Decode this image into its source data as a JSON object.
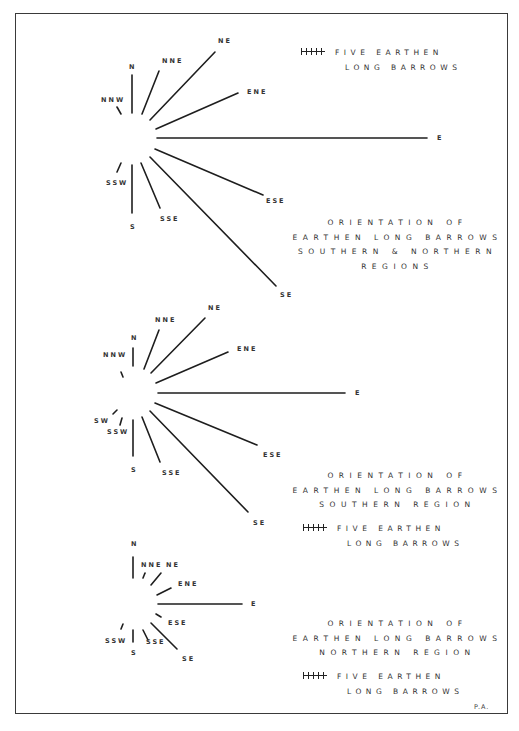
{
  "figure": {
    "signature": "P.A.",
    "legend": {
      "scale_icon": "tally-scale-icon",
      "line1": "FIVE EARTHEN",
      "line2": "LONG BARROWS"
    },
    "roses": [
      {
        "id": "combined",
        "caption": [
          "ORIENTATION OF",
          "EARTHEN LONG BARROWS",
          "SOUTHERN & NORTHERN",
          "REGIONS"
        ],
        "directions": [
          {
            "label": "N",
            "x1": 132,
            "y1": 113,
            "x2": 132,
            "y2": 75,
            "lx": 129,
            "ly": 64
          },
          {
            "label": "NNE",
            "x1": 142,
            "y1": 114,
            "x2": 159,
            "y2": 71,
            "lx": 162,
            "ly": 58
          },
          {
            "label": "NE",
            "x1": 150,
            "y1": 120,
            "x2": 215,
            "y2": 52,
            "lx": 218,
            "ly": 38
          },
          {
            "label": "ENE",
            "x1": 156,
            "y1": 129,
            "x2": 238,
            "y2": 93,
            "lx": 247,
            "ly": 89
          },
          {
            "label": "E",
            "x1": 157,
            "y1": 138,
            "x2": 427,
            "y2": 138,
            "lx": 437,
            "ly": 135
          },
          {
            "label": "ESE",
            "x1": 155,
            "y1": 149,
            "x2": 263,
            "y2": 195,
            "lx": 266,
            "ly": 198
          },
          {
            "label": "SE",
            "x1": 150,
            "y1": 157,
            "x2": 276,
            "y2": 286,
            "lx": 280,
            "ly": 292
          },
          {
            "label": "SSE",
            "x1": 141,
            "y1": 163,
            "x2": 160,
            "y2": 208,
            "lx": 160,
            "ly": 216
          },
          {
            "label": "S",
            "x1": 132,
            "y1": 165,
            "x2": 132,
            "y2": 213,
            "lx": 130,
            "ly": 224
          },
          {
            "label": "SSW",
            "x1": 121,
            "y1": 163,
            "x2": 117,
            "y2": 172,
            "lx": 106,
            "ly": 180
          },
          {
            "label": "NNW",
            "x1": 117,
            "y1": 107,
            "x2": 121,
            "y2": 114,
            "lx": 101,
            "ly": 97
          }
        ]
      },
      {
        "id": "southern",
        "caption": [
          "ORIENTATION OF",
          "EARTHEN LONG BARROWS",
          "SOUTHERN REGION"
        ],
        "directions": [
          {
            "label": "N",
            "x1": 133,
            "y1": 366,
            "x2": 133,
            "y2": 348,
            "lx": 131,
            "ly": 335
          },
          {
            "label": "NNE",
            "x1": 144,
            "y1": 369,
            "x2": 159,
            "y2": 330,
            "lx": 155,
            "ly": 317
          },
          {
            "label": "NE",
            "x1": 151,
            "y1": 373,
            "x2": 205,
            "y2": 318,
            "lx": 208,
            "ly": 305
          },
          {
            "label": "ENE",
            "x1": 156,
            "y1": 383,
            "x2": 228,
            "y2": 352,
            "lx": 237,
            "ly": 346
          },
          {
            "label": "E",
            "x1": 158,
            "y1": 393,
            "x2": 345,
            "y2": 393,
            "lx": 355,
            "ly": 390
          },
          {
            "label": "ESE",
            "x1": 155,
            "y1": 403,
            "x2": 257,
            "y2": 445,
            "lx": 263,
            "ly": 452
          },
          {
            "label": "SE",
            "x1": 150,
            "y1": 411,
            "x2": 248,
            "y2": 512,
            "lx": 253,
            "ly": 520
          },
          {
            "label": "SSE",
            "x1": 142,
            "y1": 417,
            "x2": 160,
            "y2": 462,
            "lx": 162,
            "ly": 470
          },
          {
            "label": "S",
            "x1": 133,
            "y1": 420,
            "x2": 133,
            "y2": 456,
            "lx": 131,
            "ly": 467
          },
          {
            "label": "SSW",
            "x1": 122,
            "y1": 418,
            "x2": 120,
            "y2": 425,
            "lx": 107,
            "ly": 429
          },
          {
            "label": "SW",
            "x1": 117,
            "y1": 410,
            "x2": 113,
            "y2": 414,
            "lx": 94,
            "ly": 418
          },
          {
            "label": "NNW",
            "x1": 121,
            "y1": 372,
            "x2": 123,
            "y2": 377,
            "lx": 103,
            "ly": 352
          }
        ]
      },
      {
        "id": "northern",
        "caption": [
          "ORIENTATION OF",
          "EARTHEN LONG BARROWS",
          "NORTHERN REGION"
        ],
        "directions": [
          {
            "label": "N",
            "x1": 133,
            "y1": 578,
            "x2": 133,
            "y2": 557,
            "lx": 131,
            "ly": 541
          },
          {
            "label": "NNE",
            "x1": 143,
            "y1": 578,
            "x2": 145,
            "y2": 573,
            "lx": 141,
            "ly": 562
          },
          {
            "label": "NE",
            "x1": 151,
            "y1": 585,
            "x2": 161,
            "y2": 573,
            "lx": 166,
            "ly": 562
          },
          {
            "label": "ENE",
            "x1": 157,
            "y1": 595,
            "x2": 171,
            "y2": 588,
            "lx": 178,
            "ly": 581
          },
          {
            "label": "E",
            "x1": 158,
            "y1": 604,
            "x2": 242,
            "y2": 604,
            "lx": 251,
            "ly": 601
          },
          {
            "label": "ESE",
            "x1": 156,
            "y1": 614,
            "x2": 161,
            "y2": 617,
            "lx": 168,
            "ly": 620
          },
          {
            "label": "SE",
            "x1": 151,
            "y1": 623,
            "x2": 177,
            "y2": 649,
            "lx": 182,
            "ly": 656
          },
          {
            "label": "SSE",
            "x1": 143,
            "y1": 630,
            "x2": 148,
            "y2": 640,
            "lx": 146,
            "ly": 639
          },
          {
            "label": "S",
            "x1": 133,
            "y1": 630,
            "x2": 133,
            "y2": 642,
            "lx": 131,
            "ly": 650
          },
          {
            "label": "SSW",
            "x1": 121,
            "y1": 629,
            "x2": 123,
            "y2": 624,
            "lx": 105,
            "ly": 638
          }
        ]
      }
    ]
  }
}
